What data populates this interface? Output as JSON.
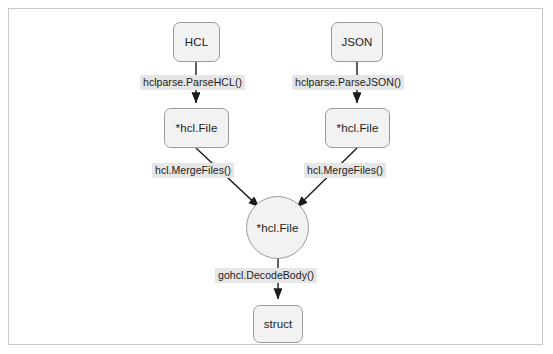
{
  "figure": {
    "clipped_caption_above": "",
    "frame_border_color": "#c9c9c9",
    "background_color": "#ffffff"
  },
  "diagram": {
    "type": "flowchart",
    "node_fill": "#f2f2f2",
    "node_stroke": "#9a9a9a",
    "edge_color": "#1b1b1b",
    "label_background": "#e6e6e6",
    "nodes": [
      {
        "id": "hcl_source",
        "label": "HCL",
        "shape": "rounded-rect"
      },
      {
        "id": "json_source",
        "label": "JSON",
        "shape": "rounded-rect"
      },
      {
        "id": "hcl_file_left",
        "label": "*hcl.File",
        "shape": "rounded-rect"
      },
      {
        "id": "hcl_file_right",
        "label": "*hcl.File",
        "shape": "rounded-rect"
      },
      {
        "id": "hcl_file_merged",
        "label": "*hcl.File",
        "shape": "circle"
      },
      {
        "id": "struct_out",
        "label": "struct",
        "shape": "rounded-rect"
      }
    ],
    "edges": [
      {
        "from": "hcl_source",
        "to": "hcl_file_left",
        "label": "hclparse.ParseHCL()"
      },
      {
        "from": "json_source",
        "to": "hcl_file_right",
        "label": "hclparse.ParseJSON()"
      },
      {
        "from": "hcl_file_left",
        "to": "hcl_file_merged",
        "label": "hcl.MergeFiles()"
      },
      {
        "from": "hcl_file_right",
        "to": "hcl_file_merged",
        "label": "hcl.MergeFiles()"
      },
      {
        "from": "hcl_file_merged",
        "to": "struct_out",
        "label": "gohcl.DecodeBody()"
      }
    ]
  }
}
